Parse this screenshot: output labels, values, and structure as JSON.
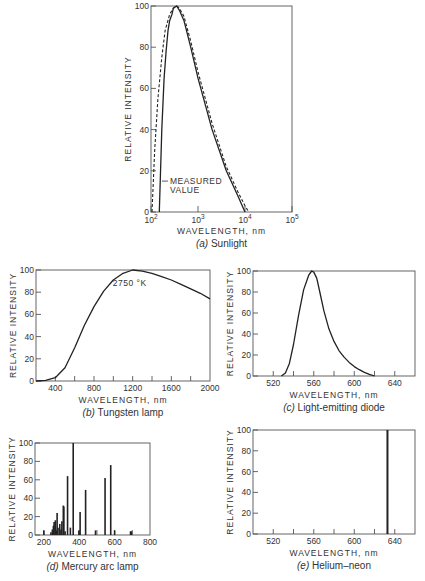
{
  "chart_data": [
    {
      "id": "a",
      "type": "line",
      "title": "(a) Sunlight",
      "xlabel": "WAVELENGTH, nm",
      "ylabel": "RELATIVE INTENSITY",
      "xscale": "log",
      "xlim": [
        100,
        100000
      ],
      "ylim": [
        0,
        100
      ],
      "xticks": [
        "10^2",
        "10^3",
        "10^4",
        "10^5"
      ],
      "yticks": [
        0,
        20,
        40,
        60,
        80,
        100
      ],
      "annotations": [
        "MEASURED VALUE"
      ],
      "series": [
        {
          "name": "Measured value",
          "style": "solid",
          "x": [
            150,
            170,
            190,
            210,
            230,
            250,
            280,
            300,
            350,
            400,
            500,
            700,
            1000,
            2000,
            4000,
            7000,
            10000
          ],
          "y": [
            0,
            40,
            65,
            78,
            88,
            93,
            96,
            99,
            100,
            98,
            93,
            80,
            65,
            40,
            20,
            8,
            0
          ]
        },
        {
          "name": "Blackbody",
          "style": "dashed",
          "x": [
            105,
            120,
            140,
            170,
            200,
            250,
            300,
            350,
            400,
            500,
            700,
            1000,
            2000,
            4000,
            7000,
            10000,
            12000
          ],
          "y": [
            0,
            30,
            55,
            75,
            88,
            96,
            99,
            100,
            99,
            95,
            83,
            68,
            43,
            22,
            10,
            3,
            0
          ]
        }
      ]
    },
    {
      "id": "b",
      "type": "line",
      "title": "(b) Tungsten lamp",
      "xlabel": "WAVELENGTH, nm",
      "ylabel": "RELATIVE INTENSITY",
      "xlim": [
        200,
        2000
      ],
      "ylim": [
        0,
        100
      ],
      "xticks": [
        400,
        800,
        1200,
        1600,
        2000
      ],
      "yticks": [
        0,
        20,
        40,
        60,
        80,
        100
      ],
      "annotations": [
        "2750 °K"
      ],
      "series": [
        {
          "name": "Tungsten 2750 K",
          "x": [
            200,
            300,
            400,
            500,
            600,
            700,
            800,
            900,
            1000,
            1100,
            1200,
            1300,
            1400,
            1500,
            1600,
            1700,
            1800,
            1900,
            2000
          ],
          "y": [
            0,
            0.5,
            3,
            12,
            30,
            50,
            67,
            81,
            91,
            97,
            100,
            99,
            97,
            94,
            91,
            87,
            83,
            79,
            74
          ]
        }
      ]
    },
    {
      "id": "c",
      "type": "line",
      "title": "(c) Light-emitting diode",
      "xlabel": "WAVELENGTH, nm",
      "ylabel": "RELATIVE INTENSITY",
      "xlim": [
        500,
        660
      ],
      "ylim": [
        0,
        100
      ],
      "xticks": [
        520,
        560,
        600,
        640
      ],
      "yticks": [
        0,
        20,
        40,
        60,
        80,
        100
      ],
      "series": [
        {
          "name": "LED",
          "x": [
            528,
            532,
            536,
            540,
            545,
            550,
            555,
            558,
            560,
            563,
            566,
            570,
            575,
            580,
            585,
            590,
            595,
            600,
            605,
            610,
            615,
            620
          ],
          "y": [
            0,
            3,
            12,
            30,
            58,
            82,
            96,
            100,
            99,
            93,
            80,
            62,
            45,
            33,
            24,
            18,
            13,
            9,
            6,
            3.5,
            1.5,
            0
          ]
        }
      ]
    },
    {
      "id": "d",
      "type": "bar",
      "title": "(d) Mercury arc lamp",
      "xlabel": "WAVELENGTH, nm",
      "ylabel": "RELATIVE INTENSITY",
      "xlim": [
        150,
        800
      ],
      "ylim": [
        0,
        100
      ],
      "xticks": [
        200,
        400,
        600,
        800
      ],
      "yticks": [
        0,
        20,
        40,
        60,
        80,
        100
      ],
      "lines": [
        {
          "x": 200,
          "y": 5
        },
        {
          "x": 240,
          "y": 3
        },
        {
          "x": 248,
          "y": 6
        },
        {
          "x": 254,
          "y": 10
        },
        {
          "x": 258,
          "y": 14
        },
        {
          "x": 265,
          "y": 16
        },
        {
          "x": 270,
          "y": 5
        },
        {
          "x": 275,
          "y": 24
        },
        {
          "x": 280,
          "y": 8
        },
        {
          "x": 290,
          "y": 12
        },
        {
          "x": 297,
          "y": 6
        },
        {
          "x": 302,
          "y": 15
        },
        {
          "x": 310,
          "y": 32
        },
        {
          "x": 313,
          "y": 31
        },
        {
          "x": 320,
          "y": 4
        },
        {
          "x": 334,
          "y": 64
        },
        {
          "x": 350,
          "y": 8
        },
        {
          "x": 366,
          "y": 100
        },
        {
          "x": 398,
          "y": 5
        },
        {
          "x": 405,
          "y": 25
        },
        {
          "x": 436,
          "y": 49
        },
        {
          "x": 492,
          "y": 5
        },
        {
          "x": 546,
          "y": 62
        },
        {
          "x": 578,
          "y": 76
        },
        {
          "x": 600,
          "y": 5
        },
        {
          "x": 690,
          "y": 4
        },
        {
          "x": 695,
          "y": 4
        }
      ]
    },
    {
      "id": "e",
      "type": "bar",
      "title": "(e) Helium–neon",
      "xlabel": "WAVELENGTH, nm",
      "ylabel": "RELATIVE INTENSITY",
      "xlim": [
        500,
        660
      ],
      "ylim": [
        0,
        100
      ],
      "xticks": [
        520,
        560,
        600,
        640
      ],
      "yticks": [
        0,
        20,
        40,
        60,
        80,
        100
      ],
      "lines": [
        {
          "x": 632.8,
          "y": 100
        }
      ]
    }
  ],
  "labels": {
    "ylabel": "RELATIVE INTENSITY",
    "xlabel": "WAVELENGTH, nm",
    "measured": [
      "MEASURED",
      "VALUE"
    ],
    "tungsten_temp": "2750 °K",
    "cap_a_letter": "(a)",
    "cap_a_text": "Sunlight",
    "cap_b_letter": "(b)",
    "cap_b_text": "Tungsten lamp",
    "cap_c_letter": "(c)",
    "cap_c_text": "Light-emitting diode",
    "cap_d_letter": "(d)",
    "cap_d_text": "Mercury arc lamp",
    "cap_e_letter": "(e)",
    "cap_e_text": "Helium–neon",
    "a_x": [
      "10",
      "2",
      "10",
      "3",
      "10",
      "4",
      "10",
      "5"
    ]
  }
}
